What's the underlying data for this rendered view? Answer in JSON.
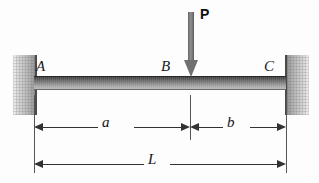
{
  "figure": {
    "background_color": "#fdfdfd"
  },
  "beam": {
    "label": "beam",
    "color_top": "#3f3f3f",
    "color_bottom": "#b9b9b9"
  },
  "supports": {
    "left": {
      "name": "fixed-support-left",
      "color": "#c9c9c9"
    },
    "right": {
      "name": "fixed-support-right",
      "color": "#c9c9c9"
    }
  },
  "nodes": [
    {
      "id": "A",
      "label": "A"
    },
    {
      "id": "B",
      "label": "B"
    },
    {
      "id": "C",
      "label": "C"
    }
  ],
  "load": {
    "label": "P",
    "direction": "down",
    "color": "#707070"
  },
  "dimensions": [
    {
      "id": "a",
      "label": "a",
      "from": "A",
      "to": "B"
    },
    {
      "id": "b",
      "label": "b",
      "from": "B",
      "to": "C"
    },
    {
      "id": "L",
      "label": "L",
      "from": "A",
      "to": "C"
    }
  ]
}
